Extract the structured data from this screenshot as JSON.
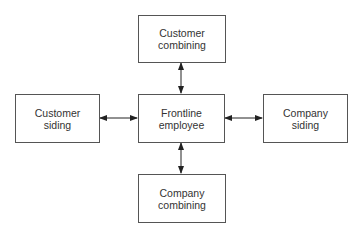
{
  "diagram": {
    "type": "hub-and-spoke",
    "nodes": {
      "top": {
        "label": "Customer\ncombining"
      },
      "left": {
        "label": "Customer\nsiding"
      },
      "center": {
        "label": "Frontline\nemployee"
      },
      "right": {
        "label": "Company\nsiding"
      },
      "bottom": {
        "label": "Company\ncombining"
      }
    },
    "edges": [
      {
        "from": "center",
        "to": "top",
        "direction": "bidirectional"
      },
      {
        "from": "center",
        "to": "left",
        "direction": "bidirectional"
      },
      {
        "from": "center",
        "to": "right",
        "direction": "bidirectional"
      },
      {
        "from": "center",
        "to": "bottom",
        "direction": "bidirectional"
      }
    ]
  }
}
